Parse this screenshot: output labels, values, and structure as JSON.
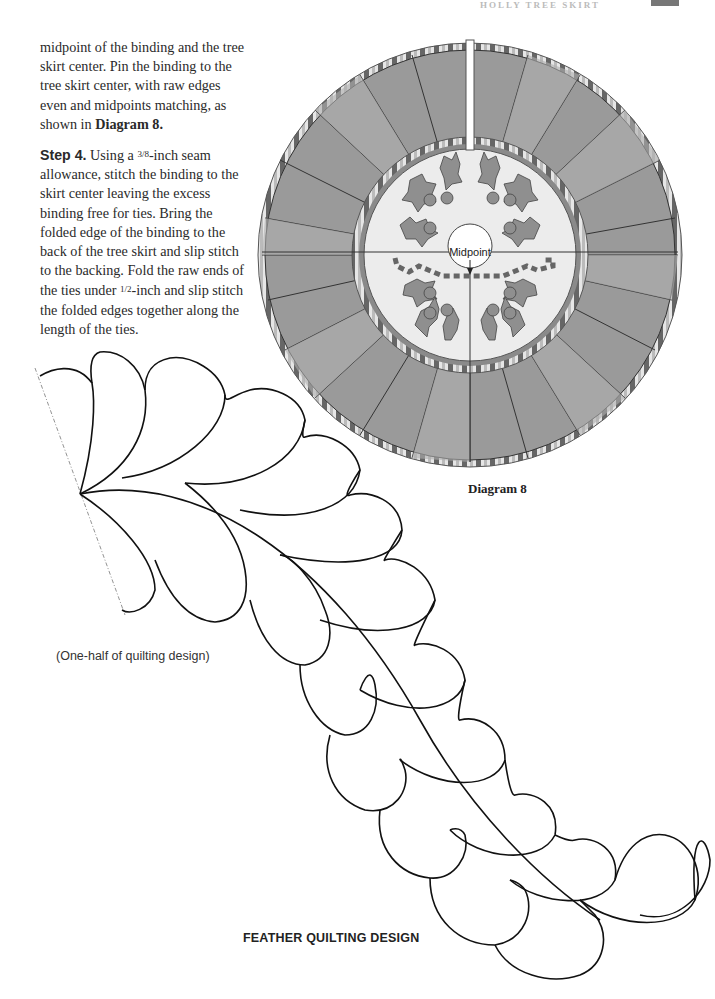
{
  "header": {
    "running_head": "HOLLY TREE SKIRT",
    "page_tab": ""
  },
  "body": {
    "paragraph_1_text": "midpoint of the binding and the tree skirt center. Pin the binding to the tree skirt center, with raw edges even and midpoints matching, as shown in ",
    "paragraph_1_ref": "Diagram 8.",
    "step_label": "Step 4.",
    "step_4_part1": " Using a ",
    "step_4_frac1": "3/8",
    "step_4_part2": "-inch seam allowance, stitch the binding to the skirt center leaving the excess binding free for ties. Bring the folded edge of the binding to the back of the tree skirt and slip stitch to the backing. Fold the raw ends of the ties under ",
    "step_4_frac2": "1/2",
    "step_4_part3": "-inch and slip stitch the folded edges together along the length of the ties."
  },
  "diagram": {
    "midpoint_label": "Midpoint",
    "caption": "Diagram 8",
    "colors": {
      "petal_dark": "#8e8e8e",
      "petal_light": "#a9a9a9",
      "center_fill": "#ececec",
      "ring": "#8a8a8a",
      "leaf": "#8f8f8f",
      "outline": "#333333"
    }
  },
  "quilting": {
    "half_caption": "(One-half of quilting design)",
    "title": "FEATHER QUILTING DESIGN"
  }
}
